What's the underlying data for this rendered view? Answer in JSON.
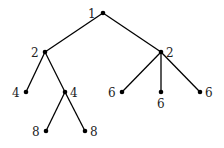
{
  "diagram": {
    "type": "tree",
    "nodes": [
      {
        "id": "n0",
        "label": "1",
        "x": 103,
        "y": 13,
        "lx": 88,
        "ly": 18
      },
      {
        "id": "n1",
        "label": "2",
        "x": 45,
        "y": 52,
        "lx": 31,
        "ly": 57
      },
      {
        "id": "n2",
        "label": "2",
        "x": 161,
        "y": 52,
        "lx": 166,
        "ly": 57
      },
      {
        "id": "n3",
        "label": "4",
        "x": 26,
        "y": 92,
        "lx": 12,
        "ly": 97
      },
      {
        "id": "n4",
        "label": "4",
        "x": 65,
        "y": 92,
        "lx": 70,
        "ly": 97
      },
      {
        "id": "n5",
        "label": "6",
        "x": 122,
        "y": 92,
        "lx": 108,
        "ly": 97
      },
      {
        "id": "n6",
        "label": "6",
        "x": 161,
        "y": 92,
        "lx": 157,
        "ly": 108
      },
      {
        "id": "n7",
        "label": "6",
        "x": 200,
        "y": 92,
        "lx": 205,
        "ly": 97
      },
      {
        "id": "n8",
        "label": "8",
        "x": 46,
        "y": 131,
        "lx": 32,
        "ly": 136
      },
      {
        "id": "n9",
        "label": "8",
        "x": 85,
        "y": 131,
        "lx": 90,
        "ly": 136
      }
    ],
    "edges": [
      [
        "n0",
        "n1"
      ],
      [
        "n0",
        "n2"
      ],
      [
        "n1",
        "n3"
      ],
      [
        "n1",
        "n4"
      ],
      [
        "n2",
        "n5"
      ],
      [
        "n2",
        "n6"
      ],
      [
        "n2",
        "n7"
      ],
      [
        "n4",
        "n8"
      ],
      [
        "n4",
        "n9"
      ]
    ]
  }
}
